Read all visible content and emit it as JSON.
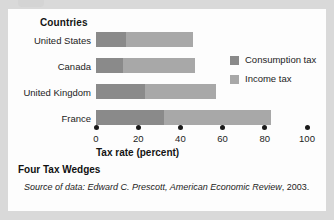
{
  "chart_data": {
    "type": "bar",
    "orientation": "horizontal",
    "stacked": true,
    "title": "Four Tax Wedges",
    "group_axis_title": "Countries",
    "xlabel": "Tax rate (percent)",
    "ylabel": "",
    "xlim": [
      0,
      100
    ],
    "xticks": [
      0,
      20,
      40,
      60,
      80,
      100
    ],
    "xtick_labels": [
      "0",
      "20",
      "40",
      "60",
      "80",
      "100"
    ],
    "grid": false,
    "legend_position": "right",
    "categories": [
      "United States",
      "Canada",
      "United Kingdom",
      "France"
    ],
    "series": [
      {
        "name": "Consumption tax",
        "color": "#8a8a8a",
        "values": [
          14,
          13,
          23,
          32
        ]
      },
      {
        "name": "Income tax",
        "color": "#a8a8a8",
        "values": [
          32,
          34,
          34,
          51
        ]
      }
    ],
    "totals": [
      46,
      47,
      57,
      83
    ],
    "source_note": "Source of data: Edward C. Prescott, American Economic Review, 2003.",
    "source_note_parts": {
      "lead": "Source of data: Edward C. Prescott, ",
      "journal": "American Economic Review",
      "tail": ", 2003."
    }
  },
  "axis": {
    "group_title": "Countries",
    "x_title": "Tax rate (percent)",
    "ticks": [
      "0",
      "20",
      "40",
      "60",
      "80",
      "100"
    ]
  },
  "rows": [
    {
      "label": "United States",
      "consumption": 14,
      "income": 32,
      "total": 46
    },
    {
      "label": "Canada",
      "consumption": 13,
      "income": 34,
      "total": 47
    },
    {
      "label": "United Kingdom",
      "consumption": 23,
      "income": 34,
      "total": 57
    },
    {
      "label": "France",
      "consumption": 32,
      "income": 51,
      "total": 83
    }
  ],
  "legend": {
    "items": [
      {
        "label": "Consumption tax",
        "color": "#8a8a8a"
      },
      {
        "label": "Income tax",
        "color": "#a8a8a8"
      }
    ]
  },
  "caption": {
    "title": "Four Tax Wedges",
    "source_lead": "Source of data: Edward C. Prescott, ",
    "source_journal": "American Economic Review",
    "source_tail": ", 2003."
  },
  "colors": {
    "consumption": "#8a8a8a",
    "income": "#a8a8a8",
    "panel": "#fdfdfd",
    "page": "#d9d9d9",
    "text": "#1c1c1c"
  }
}
